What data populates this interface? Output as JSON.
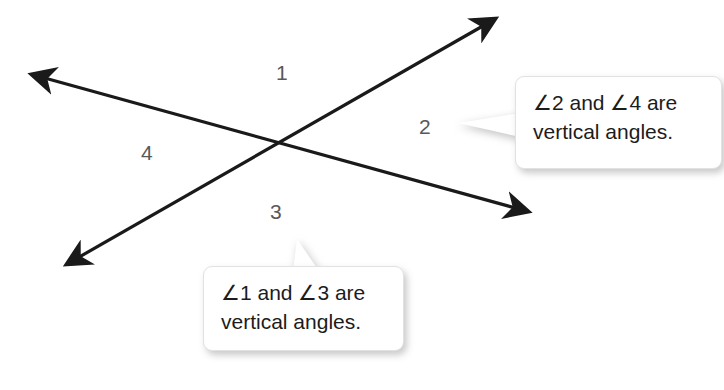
{
  "figure": {
    "background_color": "#ffffff",
    "line_color": "#1a1a1a",
    "label_color": "#58585a",
    "text_color": "#1c1c1c"
  },
  "angle_labels": [
    {
      "id": "angle-1",
      "text": "1",
      "x": 276,
      "y": 62
    },
    {
      "id": "angle-2",
      "text": "2",
      "x": 419,
      "y": 116
    },
    {
      "id": "angle-3",
      "text": "3",
      "x": 270,
      "y": 201
    },
    {
      "id": "angle-4",
      "text": "4",
      "x": 141,
      "y": 142
    }
  ],
  "lines": [
    {
      "id": "line-a",
      "description": "line through upper-left and lower-right, double-headed",
      "from": {
        "x": 27,
        "y": 73
      },
      "to": {
        "x": 533,
        "y": 213
      }
    },
    {
      "id": "line-b",
      "description": "line through lower-left and upper-right, double-headed",
      "from": {
        "x": 62,
        "y": 268
      },
      "to": {
        "x": 500,
        "y": 15
      }
    }
  ],
  "intersection": {
    "x": 280,
    "y": 145
  },
  "callouts": [
    {
      "id": "callout-vertical-24",
      "line1": "∠2 and ∠4 are",
      "line2": "vertical angles.",
      "tail_direction": "left"
    },
    {
      "id": "callout-vertical-13",
      "line1": "∠1 and ∠3 are",
      "line2": "vertical angles.",
      "tail_direction": "up"
    }
  ]
}
